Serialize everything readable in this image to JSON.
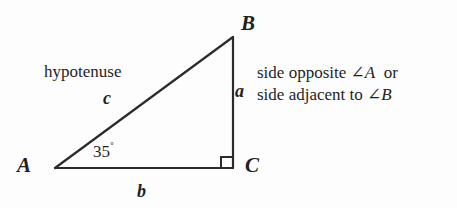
{
  "diagram": {
    "stroke_color": "#2b2b2b",
    "background_color": "#fdfdfd",
    "text_color": "#1f1f1f",
    "vertices": {
      "A": {
        "label": "A",
        "x": 55,
        "y": 168
      },
      "B": {
        "label": "B",
        "x": 233,
        "y": 37
      },
      "C": {
        "label": "C",
        "x": 233,
        "y": 168
      }
    },
    "sides": {
      "a": {
        "label": "a",
        "description": "side BC, opposite angle A"
      },
      "b": {
        "label": "b",
        "description": "side AC, base"
      },
      "c": {
        "label": "c",
        "description": "side AB, hypotenuse"
      }
    },
    "labels": {
      "hypotenuse": "hypotenuse",
      "angle_A_measure": "35",
      "degree_symbol": "˚"
    },
    "right_angle": {
      "marker": "right-angle-square",
      "at_vertex": "C",
      "size": 11
    },
    "annotation": {
      "line1": "side opposite ∠A  or",
      "line1_prefix": "side opposite ∠",
      "line1_var": "A",
      "line1_suffix": "  or",
      "line2": "side adjacent to ∠B",
      "line2_prefix": "side adjacent to ∠",
      "line2_var": "B",
      "line2_suffix": ""
    }
  }
}
